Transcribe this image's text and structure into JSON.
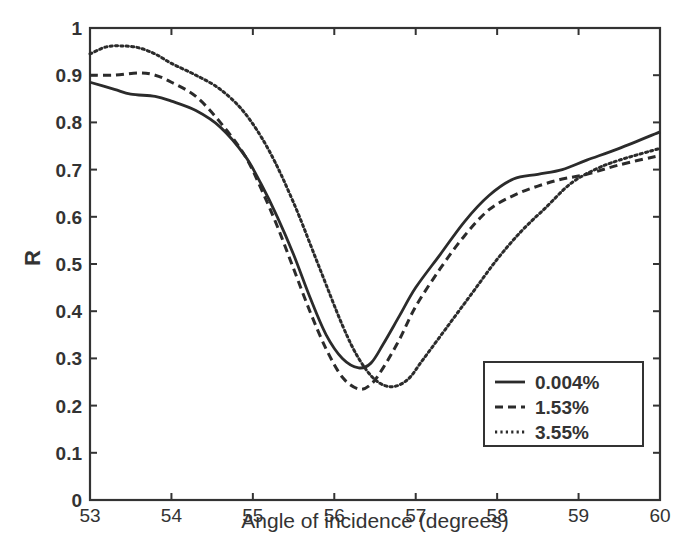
{
  "chart_data": {
    "type": "line",
    "title": "",
    "xlabel": "Angle of incidence (degrees)",
    "ylabel": "R",
    "xlim": [
      53,
      60
    ],
    "ylim": [
      0,
      1
    ],
    "xticks": [
      53,
      54,
      55,
      56,
      57,
      58,
      59,
      60
    ],
    "yticks": [
      0,
      0.1,
      0.2,
      0.3,
      0.4,
      0.5,
      0.6,
      0.7,
      0.8,
      0.9,
      1
    ],
    "xtick_labels": [
      "53",
      "54",
      "55",
      "56",
      "57",
      "58",
      "59",
      "60"
    ],
    "ytick_labels": [
      "0",
      "0.1",
      "0.2",
      "0.3",
      "0.4",
      "0.5",
      "0.6",
      "0.7",
      "0.8",
      "0.9",
      "1"
    ],
    "grid": false,
    "legend_position": "lower right",
    "series": [
      {
        "name": "0.004%",
        "style": "solid",
        "x": [
          53,
          53.3,
          53.5,
          53.8,
          54,
          54.3,
          54.6,
          54.9,
          55.1,
          55.3,
          55.5,
          55.7,
          55.9,
          56.1,
          56.3,
          56.45,
          56.6,
          56.8,
          57,
          57.3,
          57.6,
          57.9,
          58.2,
          58.5,
          58.8,
          59.1,
          59.5,
          60
        ],
        "y": [
          0.885,
          0.87,
          0.86,
          0.855,
          0.845,
          0.825,
          0.79,
          0.73,
          0.67,
          0.6,
          0.52,
          0.43,
          0.35,
          0.3,
          0.28,
          0.29,
          0.33,
          0.39,
          0.45,
          0.52,
          0.59,
          0.645,
          0.68,
          0.69,
          0.7,
          0.72,
          0.745,
          0.78
        ]
      },
      {
        "name": "1.53%",
        "style": "dashed",
        "x": [
          53,
          53.3,
          53.6,
          53.8,
          54,
          54.3,
          54.6,
          54.9,
          55.1,
          55.3,
          55.5,
          55.7,
          55.9,
          56.1,
          56.3,
          56.45,
          56.6,
          56.8,
          57,
          57.3,
          57.6,
          57.9,
          58.2,
          58.5,
          58.8,
          59.1,
          59.5,
          60
        ],
        "y": [
          0.9,
          0.9,
          0.905,
          0.9,
          0.885,
          0.855,
          0.8,
          0.73,
          0.66,
          0.58,
          0.49,
          0.4,
          0.32,
          0.26,
          0.235,
          0.245,
          0.28,
          0.34,
          0.41,
          0.49,
          0.56,
          0.615,
          0.645,
          0.665,
          0.68,
          0.69,
          0.71,
          0.73
        ]
      },
      {
        "name": "3.55%",
        "style": "dotted",
        "x": [
          53,
          53.2,
          53.4,
          53.6,
          53.8,
          54,
          54.3,
          54.6,
          54.9,
          55.2,
          55.5,
          55.8,
          56.1,
          56.3,
          56.5,
          56.7,
          56.9,
          57.1,
          57.4,
          57.7,
          58,
          58.3,
          58.6,
          58.9,
          59.2,
          59.5,
          60
        ],
        "y": [
          0.945,
          0.96,
          0.962,
          0.958,
          0.945,
          0.925,
          0.9,
          0.87,
          0.82,
          0.74,
          0.63,
          0.5,
          0.37,
          0.3,
          0.255,
          0.24,
          0.255,
          0.3,
          0.37,
          0.44,
          0.51,
          0.57,
          0.62,
          0.67,
          0.7,
          0.72,
          0.745
        ]
      }
    ]
  },
  "legend": {
    "items": [
      {
        "label": "0.004%",
        "style": "solid"
      },
      {
        "label": "1.53%",
        "style": "dashed"
      },
      {
        "label": "3.55%",
        "style": "dotted"
      }
    ]
  },
  "colors": {
    "line": "#2b2b2b",
    "axis": "#333333",
    "background": "#ffffff"
  }
}
